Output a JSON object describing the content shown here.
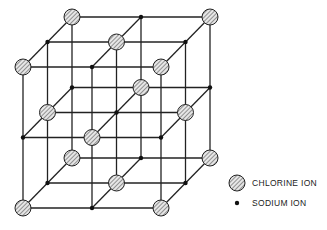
{
  "diagram": {
    "type": "crystal-lattice",
    "grid": {
      "size": 3,
      "origin": [
        23,
        67
      ],
      "step_x": 69,
      "step_y": 70.5,
      "depth_dx": 24.5,
      "depth_dy": -25
    },
    "ion_types": {
      "chlorine": {
        "radius": 8,
        "fill": "#d9d9d9",
        "stroke": "#222222",
        "hatched": true
      },
      "sodium": {
        "radius": 2.2,
        "fill": "#111111"
      }
    },
    "line_color": "#222222"
  },
  "legend": {
    "items": [
      {
        "name": "chlorine",
        "label": "CHLORINE ION"
      },
      {
        "name": "sodium",
        "label": "SODIUM ION"
      }
    ]
  }
}
